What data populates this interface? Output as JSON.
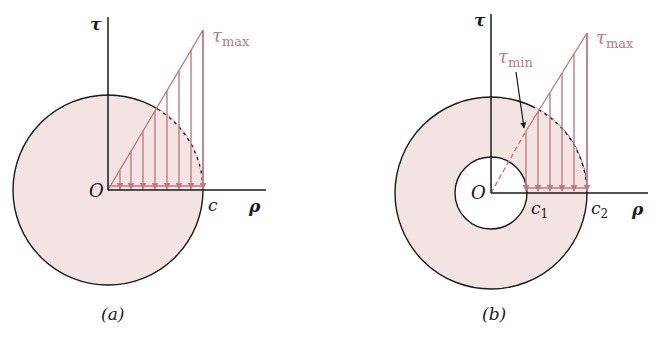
{
  "colors": {
    "fill": "#f3e3e3",
    "stress": "#c07a80",
    "ink": "#1a1a1a",
    "background": "#ffffff"
  },
  "diagram_a": {
    "caption": "(a)",
    "origin_label": "O",
    "tau_axis_label": "τ",
    "rho_axis_label": "ρ",
    "radius_label": "c",
    "tau_max_label": "τ",
    "tau_max_sub": "max"
  },
  "diagram_b": {
    "caption": "(b)",
    "origin_label": "O",
    "tau_axis_label": "τ",
    "rho_axis_label": "ρ",
    "inner_radius_label": "c",
    "inner_radius_sub": "1",
    "outer_radius_label": "c",
    "outer_radius_sub": "2",
    "tau_max_label": "τ",
    "tau_max_sub": "max",
    "tau_min_label": "τ",
    "tau_min_sub": "min"
  }
}
